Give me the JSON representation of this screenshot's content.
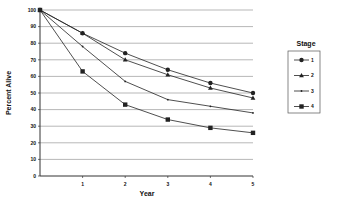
{
  "chart_data": {
    "type": "line",
    "title": "",
    "xlabel": "Year",
    "ylabel": "Percent Alive",
    "x": [
      0,
      1,
      2,
      3,
      4,
      5
    ],
    "x_tick_labels": [
      "1",
      "2",
      "3",
      "4",
      "5"
    ],
    "y_tick_labels": [
      "0",
      "10",
      "20",
      "30",
      "40",
      "50",
      "60",
      "70",
      "80",
      "90",
      "100"
    ],
    "ylim": [
      0,
      100
    ],
    "xlim": [
      0,
      5
    ],
    "grid": true,
    "legend_title": "Stage",
    "legend_position": "right",
    "series": [
      {
        "name": "1",
        "marker": "circle",
        "values": [
          100,
          86,
          74,
          64,
          56,
          50
        ]
      },
      {
        "name": "2",
        "marker": "triangle",
        "values": [
          100,
          86,
          70,
          61,
          53,
          47
        ]
      },
      {
        "name": "3",
        "marker": "dot",
        "values": [
          100,
          78,
          57,
          46,
          42,
          38
        ]
      },
      {
        "name": "4",
        "marker": "square",
        "values": [
          100,
          63,
          43,
          34,
          29,
          26
        ]
      }
    ],
    "colors": {
      "line": "#222222",
      "grid": "#9a9a9a",
      "axis": "#333333"
    }
  }
}
